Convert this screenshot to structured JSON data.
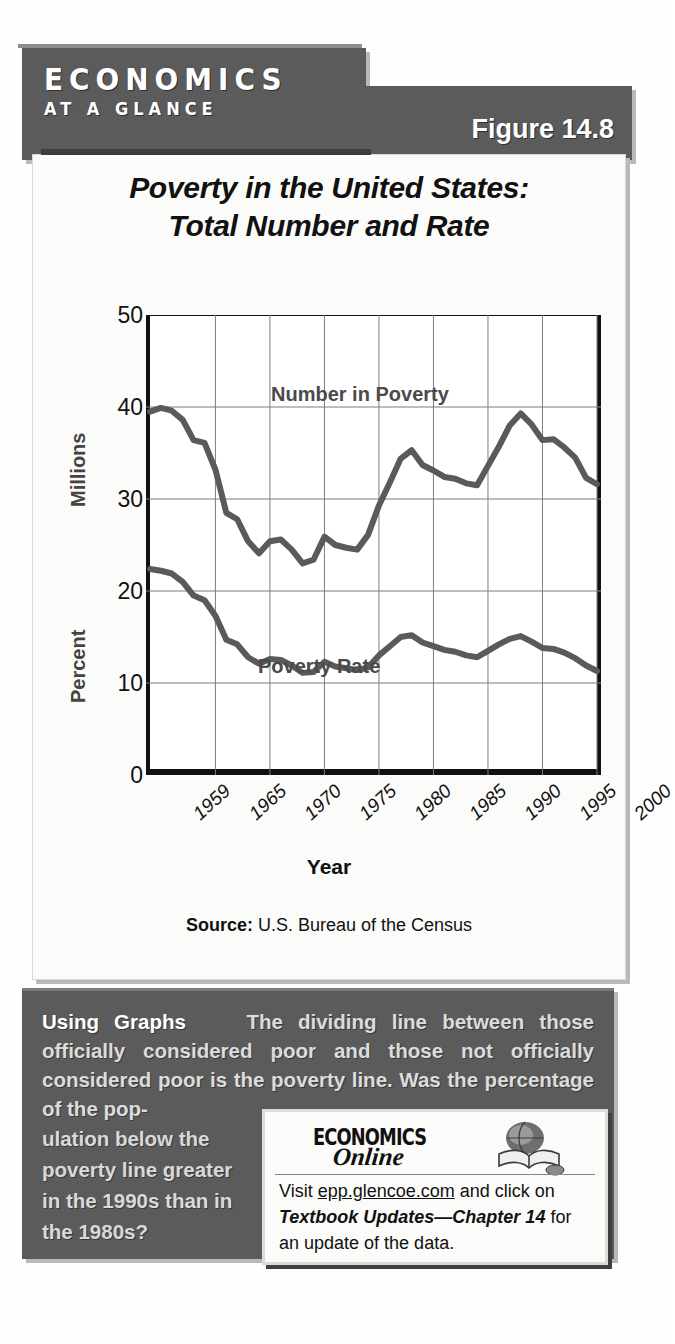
{
  "banner": {
    "brand_line1": "ECONOMICS",
    "brand_line2": "AT A GLANCE",
    "figure_number": "Figure 14.8"
  },
  "chart_title_line1": "Poverty in the United States:",
  "chart_title_line2": "Total Number and Rate",
  "axis": {
    "y_label_upper": "Millions",
    "y_label_lower": "Percent",
    "x_label": "Year",
    "y_ticks": [
      "50",
      "40",
      "30",
      "20",
      "10",
      "0"
    ],
    "x_ticks": [
      "1959",
      "1965",
      "1970",
      "1975",
      "1980",
      "1985",
      "1990",
      "1995",
      "2000"
    ]
  },
  "series_labels": {
    "number": "Number in Poverty",
    "rate": "Poverty Rate"
  },
  "source": {
    "prefix": "Source:",
    "text": " U.S. Bureau of the Census"
  },
  "caption": {
    "lead": "Using Graphs",
    "body": "The dividing line between those officially considered poor and those not officially considered poor is the poverty line.  Was the percentage of the pop-",
    "tail": "ulation below the poverty line greater in the 1990s than in the 1980s?"
  },
  "online": {
    "logo_top": "ECONOMICS",
    "logo_bottom": "Online",
    "visit_prefix": "Visit ",
    "url": "epp.glencoe.com",
    "mid": " and click on ",
    "emphasis": "Textbook Updates—Chapter 14",
    "suffix": " for an update of the data."
  },
  "colors": {
    "banner_gray": "#5b5b5b",
    "panel_white": "#fbfbf9",
    "line_gray": "#5a5a5a",
    "shadow": "#b9b9b9"
  },
  "chart_data": {
    "type": "line",
    "title": "Poverty in the United States: Total Number and Rate",
    "xlabel": "Year",
    "ylabel": "Millions / Percent",
    "xlim": [
      1959,
      2000
    ],
    "ylim": [
      0,
      50
    ],
    "grid": true,
    "legend": "inline-annotations",
    "x": [
      1959,
      1960,
      1961,
      1962,
      1963,
      1964,
      1965,
      1966,
      1967,
      1968,
      1969,
      1970,
      1971,
      1972,
      1973,
      1974,
      1975,
      1976,
      1977,
      1978,
      1979,
      1980,
      1981,
      1982,
      1983,
      1984,
      1985,
      1986,
      1987,
      1988,
      1989,
      1990,
      1991,
      1992,
      1993,
      1994,
      1995,
      1996,
      1997,
      1998,
      1999,
      2000
    ],
    "series": [
      {
        "name": "Number in Poverty",
        "unit": "millions",
        "values": [
          39.5,
          39.9,
          39.6,
          38.6,
          36.4,
          36.1,
          33.2,
          28.5,
          27.8,
          25.4,
          24.1,
          25.4,
          25.6,
          24.5,
          23.0,
          23.4,
          25.9,
          25.0,
          24.7,
          24.5,
          26.1,
          29.3,
          31.8,
          34.4,
          35.3,
          33.7,
          33.1,
          32.4,
          32.2,
          31.7,
          31.5,
          33.6,
          35.7,
          38.0,
          39.3,
          38.1,
          36.4,
          36.5,
          35.6,
          34.5,
          32.3,
          31.6
        ]
      },
      {
        "name": "Poverty Rate",
        "unit": "percent",
        "values": [
          22.4,
          22.2,
          21.9,
          21.0,
          19.5,
          19.0,
          17.3,
          14.7,
          14.2,
          12.8,
          12.1,
          12.6,
          12.5,
          11.9,
          11.1,
          11.2,
          12.3,
          11.8,
          11.6,
          11.4,
          11.7,
          13.0,
          14.0,
          15.0,
          15.2,
          14.4,
          14.0,
          13.6,
          13.4,
          13.0,
          12.8,
          13.5,
          14.2,
          14.8,
          15.1,
          14.5,
          13.8,
          13.7,
          13.3,
          12.7,
          11.9,
          11.3
        ]
      }
    ]
  }
}
